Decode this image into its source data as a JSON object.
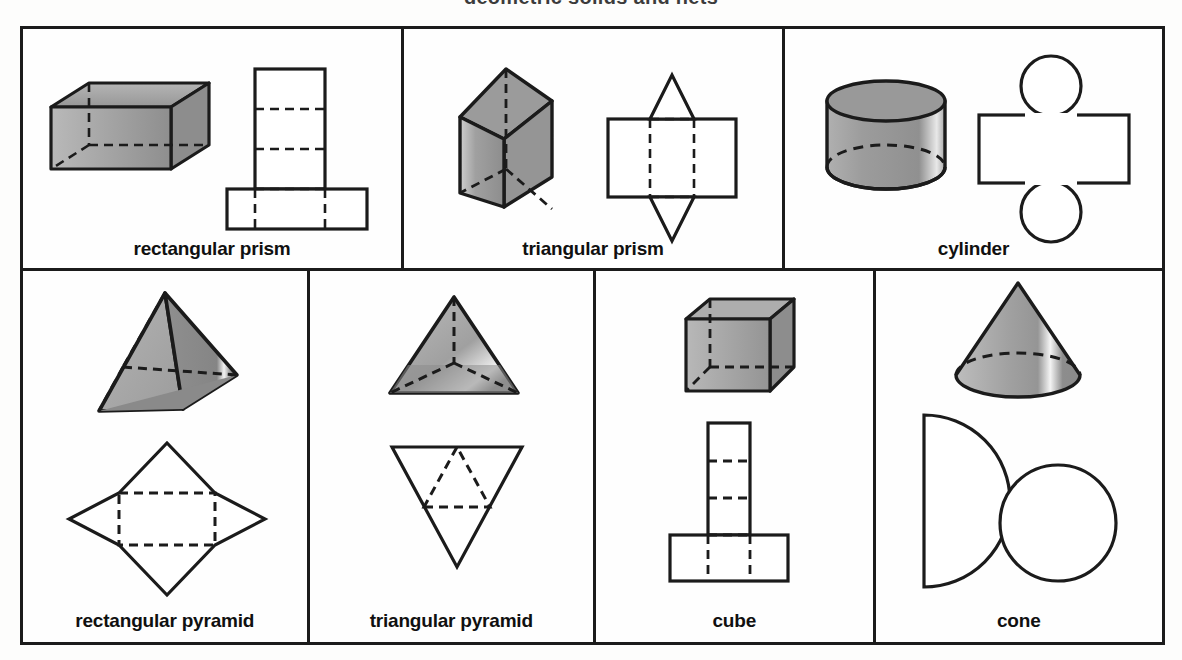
{
  "page": {
    "bleed_text": "geometric solids and nets",
    "background_color": "#fdfdfc",
    "ink_color": "#1b1b1b",
    "shade_fill": "#9a9a9a",
    "shade_fill_light": "#c2c2c2",
    "shade_fill_dark": "#7d7d7d"
  },
  "grid": {
    "rows": [
      {
        "name": "top-row",
        "cells": [
          {
            "id": "rectangular-prism",
            "label": "rectangular prism",
            "solid_icon": "rectangular-prism-solid-icon",
            "net_icon": "rectangular-prism-net-icon",
            "width_px": 383
          },
          {
            "id": "triangular-prism",
            "label": "triangular prism",
            "solid_icon": "triangular-prism-solid-icon",
            "net_icon": "triangular-prism-net-icon",
            "width_px": 383
          },
          {
            "id": "cylinder",
            "label": "cylinder",
            "solid_icon": "cylinder-solid-icon",
            "net_icon": "cylinder-net-icon",
            "width_px": 379
          }
        ]
      },
      {
        "name": "bottom-row",
        "cells": [
          {
            "id": "rectangular-pyramid",
            "label": "rectangular pyramid",
            "solid_icon": "rectangular-pyramid-solid-icon",
            "net_icon": "rectangular-pyramid-net-icon",
            "width_px": 288
          },
          {
            "id": "triangular-pyramid",
            "label": "triangular pyramid",
            "solid_icon": "triangular-pyramid-solid-icon",
            "net_icon": "triangular-pyramid-net-icon",
            "width_px": 288
          },
          {
            "id": "cube",
            "label": "cube",
            "solid_icon": "cube-solid-icon",
            "net_icon": "cube-net-icon",
            "width_px": 281
          },
          {
            "id": "cone",
            "label": "cone",
            "solid_icon": "cone-solid-icon",
            "net_icon": "cone-net-icon",
            "width_px": 288
          }
        ]
      }
    ]
  }
}
